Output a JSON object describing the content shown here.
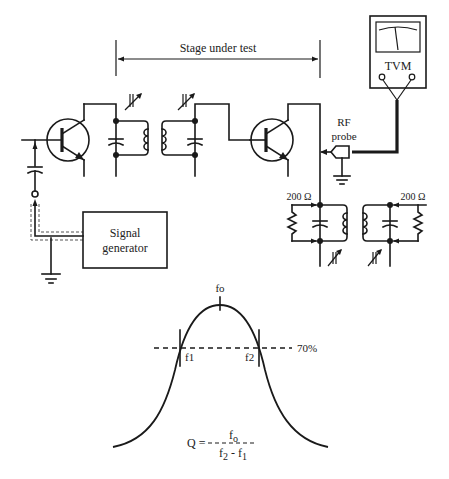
{
  "labels": {
    "stage": "Stage under test",
    "meter": "TVM",
    "probe_line1": "RF",
    "probe_line2": "probe",
    "resistor_left": "200 Ω",
    "resistor_right": "200 Ω",
    "generator_line1": "Signal",
    "generator_line2": "generator"
  },
  "response_curve": {
    "peak_label": "fo",
    "lower_label": "f1",
    "upper_label": "f2",
    "level_label": "70%",
    "formula": {
      "lhs": "Q =",
      "numerator": "f",
      "numerator_sub": "o",
      "denominator_a": "f",
      "denominator_a_sub": "2",
      "denominator_op": " - ",
      "denominator_b": "f",
      "denominator_b_sub": "1"
    }
  },
  "colors": {
    "ink": "#1a1a1a",
    "background": "#ffffff"
  }
}
